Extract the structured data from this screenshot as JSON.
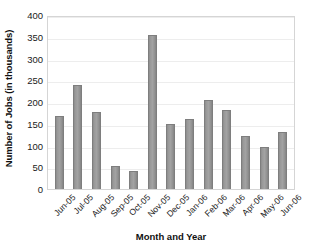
{
  "chart_data": {
    "type": "bar",
    "title": "",
    "xlabel": "Month and Year",
    "ylabel": "Number of Jobs (in thousands)",
    "categories": [
      "Jun-05",
      "Jul-05",
      "Aug-05",
      "Sep-05",
      "Oct-05",
      "Nov-05",
      "Dec-05",
      "Jan-06",
      "Feb-06",
      "Mar-06",
      "Apr-06",
      "May-06",
      "Jun-06"
    ],
    "values": [
      167,
      240,
      178,
      54,
      42,
      353,
      150,
      160,
      204,
      181,
      123,
      97,
      130
    ],
    "ylim": [
      0,
      400
    ],
    "ytick_labels": [
      "400",
      "350",
      "300",
      "250",
      "200",
      "150",
      "100",
      "50",
      "0"
    ],
    "ytick_values": [
      400,
      350,
      300,
      250,
      200,
      150,
      100,
      50,
      0
    ],
    "ytick_step": 50,
    "grid": "horizontal",
    "legend": "none",
    "bar_color": "#9a9a9a",
    "bar_edge_color": "#7e7e7e",
    "plot_border_color": "#d5d5d5",
    "gridline_color": "#ededed",
    "background_color": "#ffffff",
    "xtick_rotation": -45
  }
}
